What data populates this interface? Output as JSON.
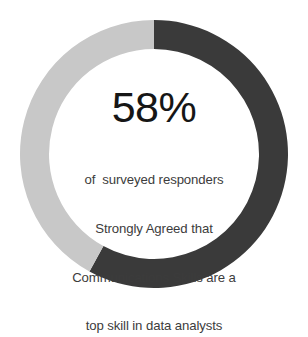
{
  "chart_data": {
    "type": "pie",
    "variant": "donut",
    "title": "",
    "subtitle": "",
    "xlabel": "",
    "ylabel": "",
    "grid": false,
    "legend_position": "none",
    "center_value": "58%",
    "center_caption_lines": [
      "of  surveyed responders",
      "Strongly Agreed that",
      "Communications Skills are a",
      "top skill in data analysts"
    ],
    "categories": [
      "Strongly Agreed",
      "Did not strongly agree"
    ],
    "values": [
      58,
      42
    ],
    "value_unit": "%",
    "slices": [
      {
        "label": "Strongly Agreed",
        "value": 58,
        "color": "#3a3a3a",
        "start_angle_deg": 0,
        "end_angle_deg": 208.8
      },
      {
        "label": "Did not strongly agree",
        "value": 42,
        "color": "#c8c8c8",
        "start_angle_deg": 208.8,
        "end_angle_deg": 360
      }
    ],
    "start_angle_note": "0 degrees at 12 o'clock, sweeping clockwise",
    "hole_ratio": 0.78
  },
  "colors": {
    "background": "#ffffff",
    "slice_dark": "#3a3a3a",
    "slice_light": "#c8c8c8",
    "value_text": "#161616",
    "caption_text": "#3c3c3c"
  },
  "geometry": {
    "center_x": 154,
    "center_y": 154,
    "outer_radius": 134,
    "inner_radius": 105
  }
}
